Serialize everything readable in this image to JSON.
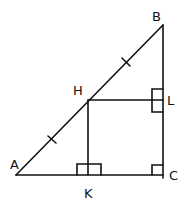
{
  "diagram": {
    "type": "geometry",
    "stroke_color": "#111111",
    "background": "#ffffff",
    "points": {
      "A": {
        "label": "A",
        "x": 16,
        "y": 175
      },
      "B": {
        "label": "B",
        "x": 163,
        "y": 25
      },
      "C": {
        "label": "C",
        "x": 163,
        "y": 175
      },
      "H": {
        "label": "H",
        "x": 88,
        "y": 100
      },
      "K": {
        "label": "K",
        "x": 88,
        "y": 175
      },
      "L": {
        "label": "L",
        "x": 163,
        "y": 100
      }
    },
    "segments": [
      {
        "from": "A",
        "to": "B"
      },
      {
        "from": "B",
        "to": "C"
      },
      {
        "from": "A",
        "to": "C"
      },
      {
        "from": "H",
        "to": "L"
      },
      {
        "from": "H",
        "to": "K"
      }
    ],
    "equal_marks": [
      {
        "segment": "AH",
        "ticks": 1
      },
      {
        "segment": "HB",
        "ticks": 1
      }
    ],
    "right_angles": [
      "C",
      "K",
      "L"
    ]
  }
}
